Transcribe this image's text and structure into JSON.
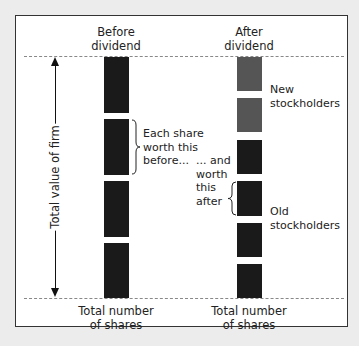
{
  "diagram": {
    "columns": {
      "before": {
        "title_line1": "Before",
        "title_line2": "dividend",
        "footer_line1": "Total number",
        "footer_line2": "of shares"
      },
      "after": {
        "title_line1": "After",
        "title_line2": "dividend",
        "footer_line1": "Total number",
        "footer_line2": "of shares"
      }
    },
    "axis_label": "Total value of firm",
    "annotations": {
      "before_brace": [
        "Each share",
        "worth this",
        "before..."
      ],
      "after_brace": [
        "... and",
        "worth",
        "this",
        "after"
      ],
      "new_stockholders": [
        "New",
        "stockholders"
      ],
      "old_stockholders": [
        "Old",
        "stockholders"
      ]
    },
    "colors": {
      "old_share": "#1a1a1a",
      "new_share": "#555555",
      "frame": "#333333",
      "dashed_line": "#888888"
    },
    "bars": {
      "before": [
        {
          "group": "old",
          "top": 57,
          "height": 56
        },
        {
          "group": "old",
          "top": 119,
          "height": 56
        },
        {
          "group": "old",
          "top": 181,
          "height": 56
        },
        {
          "group": "old",
          "top": 243,
          "height": 55
        }
      ],
      "after": [
        {
          "group": "new",
          "top": 57,
          "height": 34
        },
        {
          "group": "new",
          "top": 98,
          "height": 34
        },
        {
          "group": "old",
          "top": 140,
          "height": 34
        },
        {
          "group": "old",
          "top": 181,
          "height": 35
        },
        {
          "group": "old",
          "top": 223,
          "height": 34
        },
        {
          "group": "old",
          "top": 264,
          "height": 34
        }
      ]
    }
  }
}
